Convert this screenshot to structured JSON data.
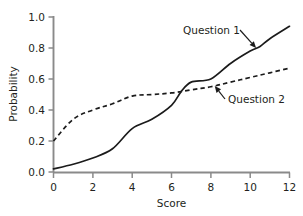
{
  "chart_data": {
    "type": "line",
    "title": "",
    "xlabel": "Score",
    "ylabel": "Probability",
    "xlim": [
      0,
      12
    ],
    "ylim": [
      0,
      1.0
    ],
    "xticks": [
      "0",
      "2",
      "4",
      "6",
      "8",
      "10",
      "12"
    ],
    "xtick_values": [
      0,
      2,
      4,
      6,
      8,
      10,
      12
    ],
    "yticks": [
      "0.0",
      "0.2",
      "0.4",
      "0.6",
      "0.8",
      "1.0"
    ],
    "ytick_values": [
      0.0,
      0.2,
      0.4,
      0.6,
      0.8,
      1.0
    ],
    "grid": false,
    "legend_position": "inline-annotations",
    "series": [
      {
        "name": "Question 1",
        "style": "solid",
        "color": "#1b1b1b",
        "x": [
          0,
          1,
          2,
          3,
          4,
          5,
          6,
          6.5,
          7,
          8,
          9,
          10,
          10.5,
          11,
          12
        ],
        "values": [
          0.02,
          0.05,
          0.09,
          0.15,
          0.28,
          0.34,
          0.43,
          0.52,
          0.58,
          0.6,
          0.7,
          0.78,
          0.81,
          0.86,
          0.94
        ]
      },
      {
        "name": "Question 2",
        "style": "dashed",
        "color": "#1b1b1b",
        "x": [
          0,
          1,
          2,
          3,
          4,
          5,
          6,
          7,
          8,
          9,
          10,
          11,
          12
        ],
        "values": [
          0.2,
          0.34,
          0.4,
          0.44,
          0.49,
          0.5,
          0.51,
          0.53,
          0.55,
          0.58,
          0.61,
          0.64,
          0.67
        ]
      }
    ],
    "annotations": [
      {
        "text": "Question 1",
        "target_x": 10.3,
        "target_y": 0.8,
        "label_x": 7.0,
        "label_y": 0.9
      },
      {
        "text": "Question 2",
        "target_x": 8.2,
        "target_y": 0.555,
        "label_x": 9.1,
        "label_y": 0.43
      }
    ]
  }
}
